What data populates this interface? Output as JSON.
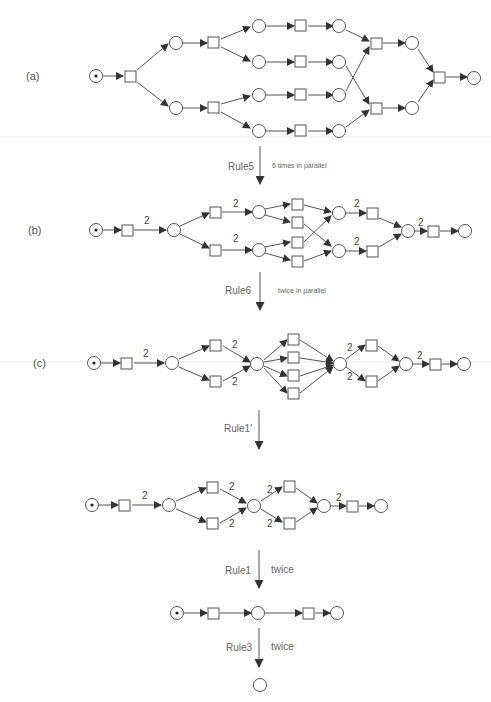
{
  "figure": {
    "panels": [
      {
        "id": "a",
        "label": "(a)"
      },
      {
        "id": "b",
        "label": "(b)"
      },
      {
        "id": "c",
        "label": "(c)"
      },
      {
        "id": "d",
        "label": ""
      },
      {
        "id": "e",
        "label": ""
      },
      {
        "id": "f",
        "label": ""
      }
    ],
    "steps": [
      {
        "rule": "Rule5",
        "note": "6 times in parallel"
      },
      {
        "rule": "Rule6",
        "note": "twice in parallel"
      },
      {
        "rule": "Rule1'",
        "note": ""
      },
      {
        "rule": "Rule1",
        "note": "twice"
      },
      {
        "rule": "Rule3",
        "note": "twice"
      }
    ],
    "arc_weight": "2",
    "node_types": {
      "place": "circle",
      "transition": "square",
      "token": "dot"
    },
    "colors": {
      "stroke": "#555555",
      "background": "#ffffff",
      "text": "#555555"
    }
  }
}
